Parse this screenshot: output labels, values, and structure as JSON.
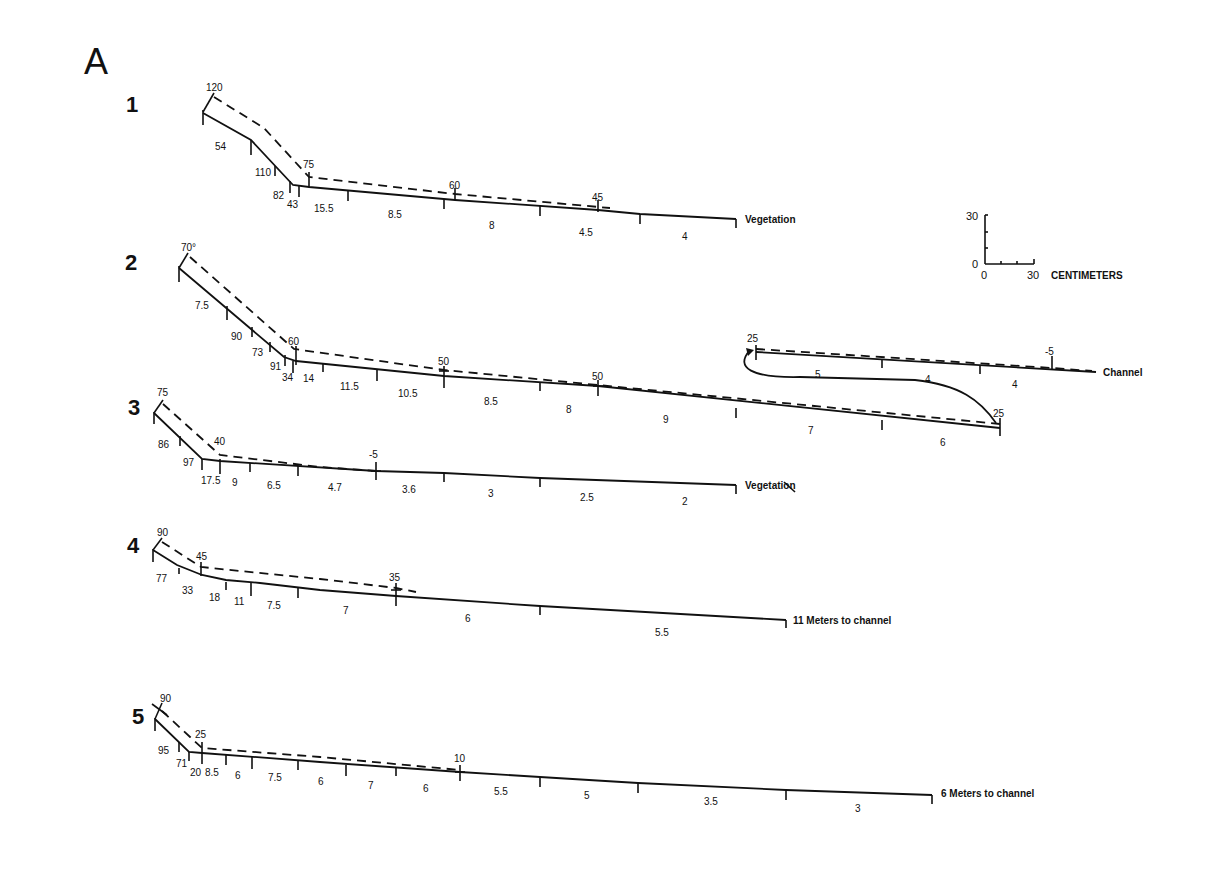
{
  "figure": {
    "panel_label": "A",
    "scale_bar": {
      "y_top": "30",
      "y_zero": "0",
      "x_zero": "0",
      "x_end": "30",
      "unit": "CENTIMETERS"
    }
  },
  "profiles": [
    {
      "number": "1",
      "crest_angles": [
        "120",
        "75",
        "60",
        "45"
      ],
      "segment_values": [
        "54",
        "110",
        "82",
        "43",
        "15.5",
        "8.5",
        "8",
        "4.5",
        "4"
      ],
      "end_label": "Vegetation"
    },
    {
      "number": "2",
      "crest_angles": [
        "70°",
        "60",
        "50",
        "50",
        "25"
      ],
      "segment_values": [
        "7.5",
        "90",
        "73",
        "91",
        "34",
        "14",
        "11.5",
        "10.5",
        "8.5",
        "8",
        "9",
        "7",
        "6"
      ],
      "continuation": {
        "crest_angles": [
          "25",
          "-5"
        ],
        "segment_values": [
          "5",
          "4",
          "4"
        ],
        "end_label": "Channel"
      }
    },
    {
      "number": "3",
      "crest_angles": [
        "75",
        "40",
        "-5"
      ],
      "segment_values": [
        "86",
        "97",
        "17.5",
        "9",
        "6.5",
        "4.7",
        "3.6",
        "3",
        "2.5",
        "2"
      ],
      "end_label": "Vegetation"
    },
    {
      "number": "4",
      "crest_angles": [
        "90",
        "45",
        "35"
      ],
      "segment_values": [
        "77",
        "33",
        "18",
        "11",
        "7.5",
        "7",
        "6",
        "5.5"
      ],
      "end_label": "11 Meters to channel"
    },
    {
      "number": "5",
      "crest_angles": [
        "90",
        "25",
        "10"
      ],
      "segment_values": [
        "95",
        "71",
        "20",
        "8.5",
        "6",
        "7.5",
        "6",
        "7",
        "6",
        "5.5",
        "5",
        "3.5",
        "3"
      ],
      "end_label": "6 Meters to channel"
    }
  ]
}
